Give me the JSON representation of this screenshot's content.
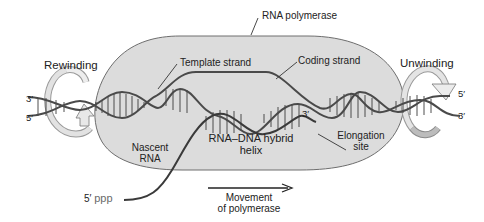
{
  "figure": {
    "labels": {
      "rna_polymerase": "RNA polymerase",
      "template_strand": "Template strand",
      "coding_strand": "Coding strand",
      "rewinding": "Rewinding",
      "unwinding": "Unwinding",
      "nascent_rna_line1": "Nascent",
      "nascent_rna_line2": "RNA",
      "hybrid_line1": "RNA–DNA hybrid",
      "hybrid_line2": "helix",
      "elongation_line1": "Elongation",
      "elongation_line2": "site",
      "movement_line1": "Movement",
      "movement_line2": "of polymerase",
      "left_top_end": "3′",
      "left_bottom_end": "5′",
      "right_top_end": "5′",
      "right_bottom_end": "3′",
      "rna_3prime_end": "3′",
      "rna_5prime": "5′",
      "rna_5prime_cap": "ppp"
    },
    "colors": {
      "polymerase_fill": "#dcdcdc",
      "polymerase_stroke": "#6e6e6e",
      "strand": "#4a4a4a",
      "rung": "#3a3a3a",
      "rna_strand": "#3a3a3a",
      "rotation_arrow": "#bdbdbd"
    }
  }
}
